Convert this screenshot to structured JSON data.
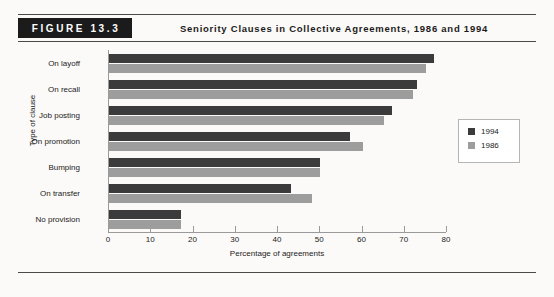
{
  "figure": {
    "tag": "FIGURE 13.3",
    "title": "Seniority Clauses in Collective Agreements, 1986 and 1994"
  },
  "chart_data": {
    "type": "bar",
    "orientation": "horizontal",
    "title": "Seniority Clauses in Collective Agreements, 1986 and 1994",
    "xlabel": "Percentage of agreements",
    "ylabel": "Type of clause",
    "xlim": [
      0,
      80
    ],
    "xticks": [
      0,
      10,
      20,
      30,
      40,
      50,
      60,
      70,
      80
    ],
    "grid": false,
    "legend_position": "right",
    "categories": [
      "On layoff",
      "On recall",
      "Job posting",
      "On promotion",
      "Bumping",
      "On transfer",
      "No provision"
    ],
    "series": [
      {
        "name": "1994",
        "color": "#3b3b3b",
        "values": [
          77,
          73,
          67,
          57,
          50,
          43,
          17
        ]
      },
      {
        "name": "1986",
        "color": "#9d9d9d",
        "values": [
          75,
          72,
          65,
          60,
          50,
          48,
          17
        ]
      }
    ]
  }
}
